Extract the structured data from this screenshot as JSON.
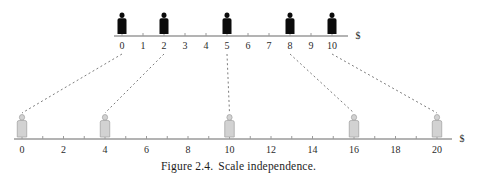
{
  "figure": {
    "caption_label": "Figure 2.4.",
    "caption_text": "Scale independence."
  },
  "chart_data": {
    "type": "scatter",
    "title": "Scale independence",
    "axes": [
      {
        "name": "top-axis",
        "label": "$",
        "unit": "$",
        "range": [
          0,
          10
        ],
        "tick_step": 1,
        "tick_labels": [
          "0",
          "1",
          "2",
          "3",
          "4",
          "5",
          "6",
          "7",
          "8",
          "9",
          "10"
        ],
        "tick_values": [
          0,
          1,
          2,
          3,
          4,
          5,
          6,
          7,
          8,
          9,
          10
        ],
        "marker_style": "dark-person",
        "marker_color": "#0b0b0b",
        "data_points": [
          0,
          2,
          5,
          8,
          10
        ]
      },
      {
        "name": "bottom-axis",
        "label": "$",
        "unit": "$",
        "range": [
          0,
          21
        ],
        "tick_step": 1,
        "tick_labels": [
          "0",
          "2",
          "4",
          "6",
          "8",
          "10",
          "12",
          "14",
          "16",
          "18",
          "20"
        ],
        "tick_values": [
          0,
          2,
          4,
          6,
          8,
          10,
          12,
          14,
          16,
          18,
          20
        ],
        "marker_style": "light-person",
        "marker_color": "#d2d2d2",
        "data_points": [
          0,
          4,
          10,
          16,
          20
        ]
      }
    ],
    "mapping": [
      {
        "top": 0,
        "bottom": 0
      },
      {
        "top": 2,
        "bottom": 4
      },
      {
        "top": 5,
        "bottom": 10
      },
      {
        "top": 8,
        "bottom": 16
      },
      {
        "top": 10,
        "bottom": 20
      }
    ],
    "grid": false,
    "legend": "none",
    "colors": {
      "axis": "#9a9a9a",
      "connector": "#7d7d7d",
      "dark_marker": "#0b0b0b",
      "light_marker": "#d2d2d2",
      "text": "#2b2b2b"
    }
  }
}
